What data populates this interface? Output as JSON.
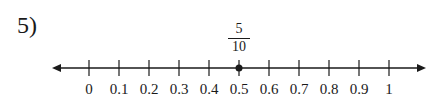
{
  "problem": {
    "number_label": "5)",
    "fraction": {
      "numerator": "5",
      "denominator": "10"
    },
    "marked_value": 0.5
  },
  "number_line": {
    "min": 0,
    "max": 1,
    "step": 0.1,
    "arrows": "both",
    "tick_labels": [
      "0",
      "0.1",
      "0.2",
      "0.3",
      "0.4",
      "0.5",
      "0.6",
      "0.7",
      "0.8",
      "0.9",
      "1"
    ],
    "point": {
      "value": 0.5,
      "label": "5/10"
    }
  }
}
